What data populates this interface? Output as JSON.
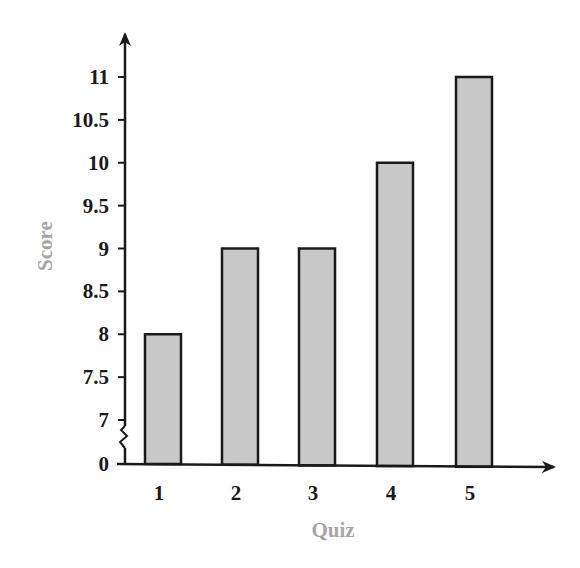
{
  "chart_data": {
    "type": "bar",
    "title": "",
    "xlabel": "Quiz",
    "ylabel": "Score",
    "categories": [
      "1",
      "2",
      "3",
      "4",
      "5"
    ],
    "values": [
      8,
      9,
      9,
      10,
      11
    ],
    "y_ticks": [
      "0",
      "7",
      "7.5",
      "8",
      "8.5",
      "9",
      "9.5",
      "10",
      "10.5",
      "11"
    ],
    "ylim": [
      7,
      11
    ],
    "y_axis_break": "between 0 and 7",
    "grid": false,
    "legend": null,
    "colors": {
      "bar_fill": "#c8c8c8",
      "bar_stroke": "#1a1a1a",
      "axis": "#1a1a1a",
      "axis_title": "#a6a6a6"
    }
  }
}
